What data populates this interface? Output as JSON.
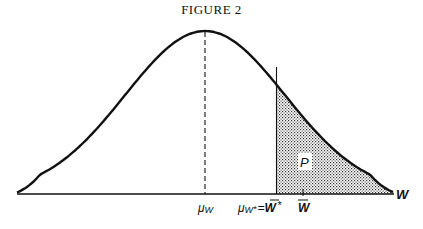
{
  "title": "FIGURE 2",
  "chart_data": {
    "type": "area",
    "title": "FIGURE 2",
    "distribution": "normal",
    "mean_label": "μW",
    "xlabel": "W",
    "ylabel": "",
    "grid": false,
    "legend": null,
    "annotations": [
      {
        "label": "μW",
        "position": "x-axis below mean, dashed vertical line to peak"
      },
      {
        "label": "μW* = W̄*",
        "position": "x-axis at the shading cutoff, solid vertical line"
      },
      {
        "label": "W̄",
        "position": "x-axis tick just right of cutoff"
      },
      {
        "label": "P",
        "position": "inside shaded tail region"
      },
      {
        "label": "W",
        "position": "right end of x-axis"
      }
    ],
    "shaded_region": {
      "from": "W̄*",
      "to": "+inf",
      "label": "P",
      "pattern": "stipple"
    },
    "pixel_geometry": {
      "mean_x": 205,
      "sigma_px": 80,
      "baseline_y": 194,
      "peak_y": 31,
      "cutoff_x": 276,
      "wbar_tick_x": 303
    }
  },
  "labels": {
    "mu_w": "μ",
    "mu_w_sub": "W",
    "mu_wstar": "μ",
    "mu_wstar_sub": "W",
    "mu_wstar_star": "*",
    "equals": "=",
    "wbar_star": "W",
    "wbar_star_sup": "*",
    "wbar": "W",
    "p": "P",
    "axis_w": "W"
  }
}
